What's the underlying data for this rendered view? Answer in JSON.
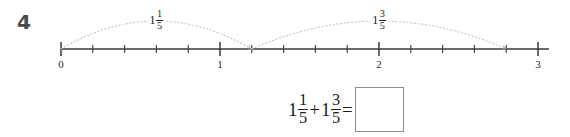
{
  "problem": {
    "number": "4"
  },
  "number_line": {
    "min": 0,
    "max": 3,
    "tick_labels": [
      "0",
      "1",
      "2",
      "3"
    ],
    "tick_label_values": [
      0,
      1,
      2,
      3
    ],
    "minor_ticks_per_unit": 5,
    "axis_color": "#3a3a3a",
    "arc_color": "#c9c9c9"
  },
  "jumps": [
    {
      "label_whole": "1",
      "label_numerator": "1",
      "label_denominator": "5",
      "from": 0,
      "to": 1.2
    },
    {
      "label_whole": "1",
      "label_numerator": "3",
      "label_denominator": "5",
      "from": 1.2,
      "to": 2.8
    }
  ],
  "equation": {
    "term1": {
      "whole": "1",
      "numerator": "1",
      "denominator": "5"
    },
    "plus": "+",
    "term2": {
      "whole": "1",
      "numerator": "3",
      "denominator": "5"
    },
    "equals": "=",
    "answer_value": ""
  }
}
